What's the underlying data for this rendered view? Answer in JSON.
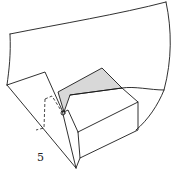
{
  "diagram": {
    "type": "origami-fold-step",
    "step_number": "5",
    "colors": {
      "line": "#1a1a1a",
      "shaded_face": "#d8d8d8",
      "background": "#ffffff"
    }
  }
}
